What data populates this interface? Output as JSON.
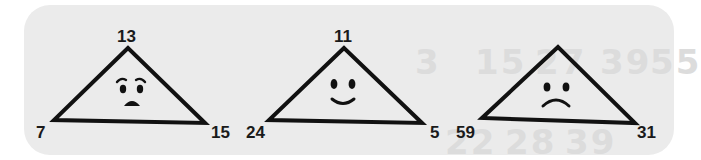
{
  "background_ghost": {
    "top_row": [
      "3",
      "15",
      "27",
      "39",
      "55"
    ],
    "bottom_row": [
      "22",
      "28",
      "39"
    ]
  },
  "triangles": [
    {
      "top": "13",
      "left": "7",
      "right": "15",
      "face": "worried",
      "apex": [
        128,
        44
      ],
      "bl": [
        52,
        120
      ],
      "br": [
        205,
        123
      ]
    },
    {
      "top": "11",
      "left": "24",
      "right": "5",
      "face": "happy",
      "apex": [
        344,
        46
      ],
      "bl": [
        270,
        119
      ],
      "br": [
        422,
        123
      ]
    },
    {
      "top": "",
      "left": "59",
      "right": "31",
      "face": "sad",
      "apex": [
        558,
        46
      ],
      "bl": [
        483,
        118
      ],
      "br": [
        635,
        123
      ]
    }
  ]
}
